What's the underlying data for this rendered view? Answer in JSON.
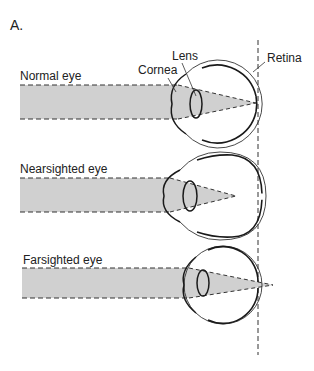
{
  "figure": {
    "panel_label": "A.",
    "retina_line_label": "Retina",
    "colors": {
      "beam": "#d0d0d0",
      "stroke": "#1a1a1a",
      "thin_stroke": "#333333",
      "background": "#ffffff"
    },
    "eyes": [
      {
        "id": "normal",
        "label": "Normal eye",
        "structure_labels": {
          "cornea": "Cornea",
          "lens": "Lens",
          "retina": "Retina"
        },
        "focus": "on retina"
      },
      {
        "id": "nearsighted",
        "label": "Nearsighted eye",
        "focus": "in front of retina"
      },
      {
        "id": "farsighted",
        "label": "Farsighted  eye",
        "focus": "behind retina"
      }
    ]
  }
}
